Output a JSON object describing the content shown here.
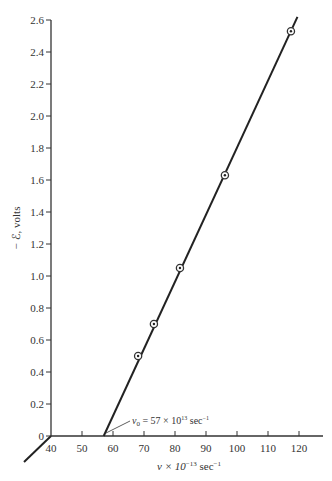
{
  "chart_data": {
    "type": "line",
    "title": "",
    "xlabel": "ν × 10⁻¹³ sec⁻¹",
    "ylabel": "− ℰ, volts",
    "xlim": [
      40,
      127
    ],
    "ylim": [
      0,
      2.6
    ],
    "x_ticks": [
      40,
      50,
      60,
      70,
      80,
      90,
      100,
      110,
      120
    ],
    "y_ticks": [
      0,
      0.2,
      0.4,
      0.6,
      0.8,
      1.0,
      1.2,
      1.4,
      1.6,
      1.8,
      2.0,
      2.2,
      2.4,
      2.6
    ],
    "y_tick_labels": [
      "0",
      "0.2",
      "0.4",
      "0.6",
      "0.8",
      "1.0",
      "1.2",
      "1.4",
      "1.6",
      "1.8",
      "2.0",
      "2.2",
      "2.4",
      "2.6"
    ],
    "grid": false,
    "legend": null,
    "series": [
      {
        "name": "measured points",
        "marker": "circled-dot",
        "x": [
          68.1,
          73.2,
          81.6,
          96.1,
          117.4
        ],
        "y": [
          0.5,
          0.7,
          1.05,
          1.63,
          2.53
        ]
      },
      {
        "name": "fitted line",
        "x": [
          57,
          119.5
        ],
        "y": [
          0,
          2.62
        ]
      }
    ],
    "annotations": [
      {
        "text": "ν₀ = 57 × 10¹³ sec⁻¹",
        "points_to": [
          57,
          0
        ]
      }
    ]
  },
  "labels": {
    "xlabel_main": "ν × 10",
    "xlabel_exp": "−13",
    "xlabel_unit": " sec",
    "xlabel_unit_exp": "−1",
    "ylabel": "− ℰ, volts",
    "annotation_prefix": "ν",
    "annotation_sub": "0",
    "annotation_mid": " = 57 × 10",
    "annotation_exp": "13",
    "annotation_unit": " sec",
    "annotation_unit_exp": "−1"
  }
}
